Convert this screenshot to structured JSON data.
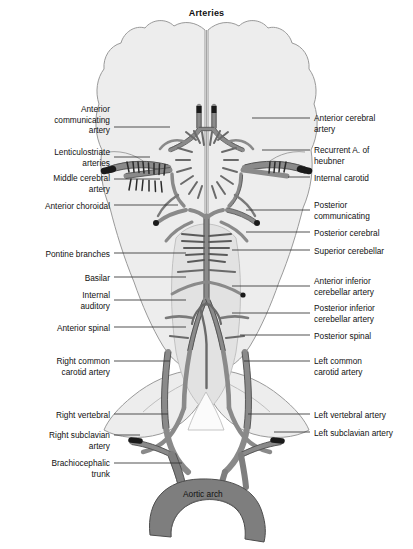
{
  "figure": {
    "title": "Arteries",
    "center_label": "Aortic arch",
    "colors": {
      "brain_fill": "#ededed",
      "brain_stroke": "#9a9a9a",
      "vessel_fill": "#8a8a8a",
      "vessel_stroke": "#4d4d4d",
      "aorta_fill": "#7e7e7e",
      "cut_end": "#1a1a1a",
      "leader": "#333333",
      "text": "#111111",
      "background": "#ffffff"
    }
  },
  "labels_left": [
    {
      "id": "anterior-communicating-artery",
      "text": "Anterior\ncommunicating\nartery",
      "x": 14,
      "y": 104,
      "w": 96,
      "leader_y": 127,
      "leader_x1": 114,
      "leader_x2": 170
    },
    {
      "id": "lenticulostriate-arteries",
      "text": "Lenticulostriate\narteries",
      "x": 14,
      "y": 147,
      "w": 96,
      "leader_y": 157,
      "leader_x1": 114,
      "leader_x2": 150
    },
    {
      "id": "middle-cerebral-artery",
      "text": "Middle cerebral\nartery",
      "x": 14,
      "y": 173,
      "w": 96,
      "leader_y": 179,
      "leader_x1": 114,
      "leader_x2": 160
    },
    {
      "id": "anterior-choroidal",
      "text": "Anterior choroidal",
      "x": 8,
      "y": 201,
      "w": 102,
      "leader_y": 205,
      "leader_x1": 114,
      "leader_x2": 178
    },
    {
      "id": "pontine-branches",
      "text": "Pontine branches",
      "x": 8,
      "y": 249,
      "w": 102,
      "leader_y": 253,
      "leader_x1": 114,
      "leader_x2": 186
    },
    {
      "id": "basilar",
      "text": "Basilar",
      "x": 8,
      "y": 273,
      "w": 102,
      "leader_y": 277,
      "leader_x1": 114,
      "leader_x2": 186
    },
    {
      "id": "internal-auditory",
      "text": "Internal\nauditory",
      "x": 8,
      "y": 290,
      "w": 102,
      "leader_y": 300,
      "leader_x1": 114,
      "leader_x2": 186
    },
    {
      "id": "anterior-spinal",
      "text": "Anterior spinal",
      "x": 8,
      "y": 323,
      "w": 102,
      "leader_y": 327,
      "leader_x1": 114,
      "leader_x2": 186
    },
    {
      "id": "right-common-carotid-artery",
      "text": "Right common\ncarotid artery",
      "x": 14,
      "y": 356,
      "w": 96,
      "leader_y": 361,
      "leader_x1": 114,
      "leader_x2": 170
    },
    {
      "id": "right-vertebral",
      "text": "Right vertebral",
      "x": 8,
      "y": 410,
      "w": 102,
      "leader_y": 414,
      "leader_x1": 114,
      "leader_x2": 168
    },
    {
      "id": "right-subclavian-artery",
      "text": "Right subclavian\nartery",
      "x": 8,
      "y": 430,
      "w": 102,
      "leader_y": 435,
      "leader_x1": 114,
      "leader_x2": 140
    },
    {
      "id": "brachiocephalic-trunk",
      "text": "Brachiocephalic\ntrunk",
      "x": 8,
      "y": 458,
      "w": 102,
      "leader_y": 463,
      "leader_x1": 114,
      "leader_x2": 182
    }
  ],
  "labels_right": [
    {
      "id": "anterior-cerebral-artery",
      "text": "Anterior cerebral\nartery",
      "x": 314,
      "y": 113,
      "w": 98,
      "leader_y": 118,
      "leader_x1": 252,
      "leader_x2": 310
    },
    {
      "id": "recurrent-a-of-heubner",
      "text": "Recurrent A. of\nheubner",
      "x": 314,
      "y": 145,
      "w": 98,
      "leader_y": 150,
      "leader_x1": 262,
      "leader_x2": 310
    },
    {
      "id": "internal-carotid",
      "text": "Internal carotid",
      "x": 314,
      "y": 173,
      "w": 98,
      "leader_y": 177,
      "leader_x1": 288,
      "leader_x2": 310
    },
    {
      "id": "posterior-communicating",
      "text": "Posterior\ncommunicating",
      "x": 314,
      "y": 200,
      "w": 98,
      "leader_y": 210,
      "leader_x1": 246,
      "leader_x2": 310
    },
    {
      "id": "posterior-cerebral",
      "text": "Posterior cerebral",
      "x": 314,
      "y": 228,
      "w": 98,
      "leader_y": 232,
      "leader_x1": 246,
      "leader_x2": 310
    },
    {
      "id": "superior-cerebellar",
      "text": "Superior cerebellar",
      "x": 314,
      "y": 246,
      "w": 98,
      "leader_y": 250,
      "leader_x1": 232,
      "leader_x2": 310
    },
    {
      "id": "anterior-inferior-cerebellar-artery",
      "text": "Anterior inferior\ncerebellar artery",
      "x": 314,
      "y": 276,
      "w": 98,
      "leader_y": 286,
      "leader_x1": 232,
      "leader_x2": 310
    },
    {
      "id": "posterior-inferior-cerebellar-artery",
      "text": "Posterior inferior\ncerebellar artery",
      "x": 314,
      "y": 303,
      "w": 98,
      "leader_y": 313,
      "leader_x1": 232,
      "leader_x2": 310
    },
    {
      "id": "posterior-spinal",
      "text": "Posterior spinal",
      "x": 314,
      "y": 331,
      "w": 98,
      "leader_y": 335,
      "leader_x1": 240,
      "leader_x2": 310
    },
    {
      "id": "left-common-carotid-artery",
      "text": "Left common\ncarotid artery",
      "x": 314,
      "y": 356,
      "w": 98,
      "leader_y": 361,
      "leader_x1": 244,
      "leader_x2": 310
    },
    {
      "id": "left-vertebral-artery",
      "text": "Left vertebral artery",
      "x": 314,
      "y": 410,
      "w": 98,
      "leader_y": 414,
      "leader_x1": 248,
      "leader_x2": 310
    },
    {
      "id": "left-subclavian-artery",
      "text": "Left subclavian artery",
      "x": 314,
      "y": 428,
      "w": 98,
      "leader_y": 432,
      "leader_x1": 274,
      "leader_x2": 310
    }
  ]
}
